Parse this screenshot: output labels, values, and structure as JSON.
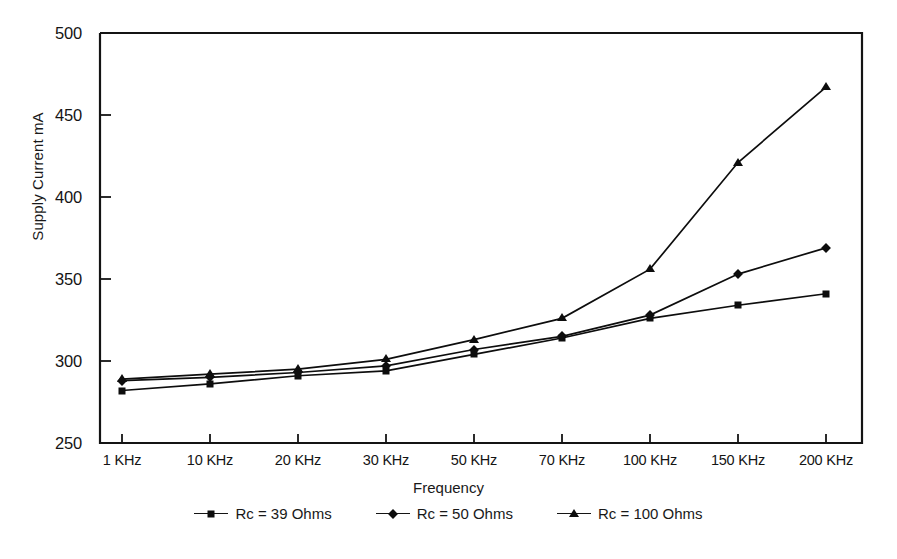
{
  "chart_data": {
    "type": "line",
    "title": "",
    "xlabel": "Frequency",
    "ylabel": "Supply Current mA",
    "categories": [
      "1 KHz",
      "10 KHz",
      "20 KHz",
      "30 KHz",
      "50 KHz",
      "70 KHz",
      "100 KHz",
      "150 KHz",
      "200 KHz"
    ],
    "ylim": [
      250,
      500
    ],
    "yticks": [
      250,
      300,
      350,
      400,
      450,
      500
    ],
    "grid": false,
    "legend_position": "bottom",
    "series": [
      {
        "name": "Rc = 39 Ohms",
        "marker": "square",
        "color": "#0d0d0d",
        "values": [
          282,
          286,
          291,
          294,
          304,
          314,
          326,
          334,
          341
        ]
      },
      {
        "name": "Rc = 50 Ohms",
        "marker": "diamond",
        "color": "#0d0d0d",
        "values": [
          288,
          290,
          293,
          297,
          307,
          315,
          328,
          353,
          369
        ]
      },
      {
        "name": "Rc = 100 Ohms",
        "marker": "triangle",
        "color": "#0d0d0d",
        "values": [
          289,
          292,
          295,
          301,
          313,
          326,
          356,
          421,
          467
        ]
      }
    ]
  },
  "axes": {
    "y_title": "Supply Current mA",
    "x_title": "Frequency",
    "y_tick_labels": [
      "500",
      "450",
      "400",
      "350",
      "300",
      "250"
    ],
    "x_tick_labels": [
      "1 KHz",
      "10 KHz",
      "20 KHz",
      "30 KHz",
      "50 KHz",
      "70 KHz",
      "100 KHz",
      "150 KHz",
      "200 KHz"
    ]
  },
  "legend": {
    "items": [
      {
        "label": "Rc = 39 Ohms",
        "marker": "square"
      },
      {
        "label": "Rc = 50 Ohms",
        "marker": "diamond"
      },
      {
        "label": "Rc = 100 Ohms",
        "marker": "triangle"
      }
    ]
  }
}
